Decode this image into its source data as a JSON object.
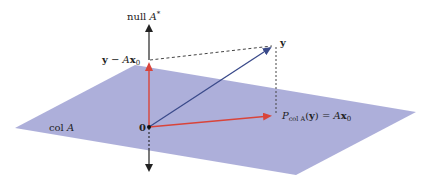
{
  "diagram": {
    "labels": {
      "null_axis": {
        "main": "null ",
        "var": "A",
        "sup": "*"
      },
      "residual": {
        "vec": "y",
        "minus": " − ",
        "mat": "A",
        "x": "x",
        "sub": "0"
      },
      "y": "y",
      "origin": "0",
      "plane": {
        "main": "col ",
        "var": "A"
      },
      "projection": {
        "P": "P",
        "sub": "col A",
        "open": "(",
        "vec": "y",
        "close": ")",
        "eq": " = ",
        "mat": "A",
        "x": "x",
        "xsub": "0"
      }
    },
    "colors": {
      "plane": "#a9abd8",
      "axis": "#222222",
      "red_vector": "#d9443a",
      "blue_vector": "#3a4a8a",
      "dashed": "#444444"
    },
    "geometry": {
      "plane_points": "15,128 135,65 416,112 296,175",
      "origin": [
        149,
        127
      ],
      "null_axis_top": [
        149,
        22
      ],
      "null_axis_bottom": [
        149,
        174
      ],
      "residual_point": [
        149,
        60
      ],
      "y_point": [
        274,
        45
      ],
      "projection_point": [
        276,
        116
      ]
    }
  }
}
